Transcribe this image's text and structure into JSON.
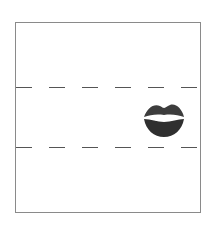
{
  "header": {
    "text": ""
  },
  "frame": {
    "border_color": "#8a8a8a",
    "dashed_lines": [
      {
        "y": 64
      },
      {
        "y": 124
      }
    ],
    "dash_color": "#555555"
  },
  "image": {
    "icon": "lips-icon",
    "color": "#3a3a3a"
  }
}
